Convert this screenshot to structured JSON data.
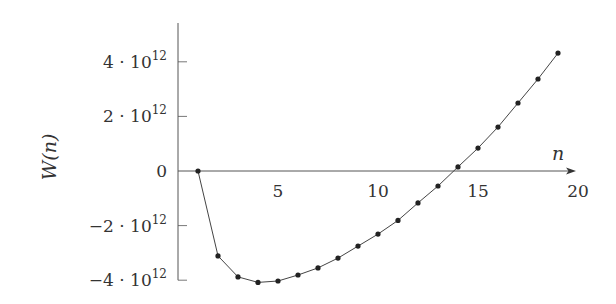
{
  "chart_data": {
    "type": "line",
    "title": "",
    "xlabel": "n",
    "ylabel": "W(n)",
    "xlim": [
      0,
      20
    ],
    "ylim": [
      -4000000000000.0,
      5500000000000.0
    ],
    "grid": false,
    "legend": null,
    "x_ticks": [
      5,
      10,
      15,
      20
    ],
    "x_tick_labels": [
      "5",
      "10",
      "15",
      "20"
    ],
    "y_ticks": [
      4000000000000.0,
      2000000000000.0,
      0,
      -2000000000000.0,
      -4000000000000.0
    ],
    "y_tick_labels": [
      {
        "mantissa": "4",
        "exp": "12",
        "text": "4 · 10^12"
      },
      {
        "mantissa": "2",
        "exp": "12",
        "text": "2 · 10^12"
      },
      {
        "mantissa": "0",
        "exp": "",
        "text": "0"
      },
      {
        "mantissa": "−2",
        "exp": "12",
        "text": "−2 · 10^12"
      },
      {
        "mantissa": "−4",
        "exp": "12",
        "text": "−4 · 10^12"
      }
    ],
    "series": [
      {
        "name": "W(n)",
        "marker": "circle",
        "x": [
          1,
          2,
          3,
          4,
          5,
          6,
          7,
          8,
          9,
          10,
          11,
          12,
          13,
          14,
          15,
          16,
          17,
          18,
          19
        ],
        "values": [
          0,
          -3110000000000.0,
          -3880000000000.0,
          -4080000000000.0,
          -4030000000000.0,
          -3810000000000.0,
          -3550000000000.0,
          -3190000000000.0,
          -2750000000000.0,
          -2310000000000.0,
          -1810000000000.0,
          -1170000000000.0,
          -550000000000.0,
          150000000000.0,
          840000000000.0,
          1610000000000.0,
          2490000000000.0,
          3370000000000.0,
          4320000000000.0
        ]
      }
    ]
  },
  "style": {
    "axis_color": "#555555",
    "line_color": "#444444",
    "marker_color": "#222222",
    "text_color": "#333333"
  }
}
